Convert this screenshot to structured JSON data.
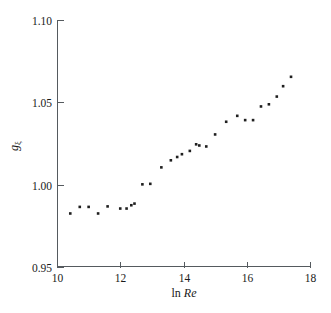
{
  "chart_data": {
    "type": "scatter",
    "title": "",
    "xlabel": "ln Re",
    "xlabel_parts": {
      "prefix": "ln ",
      "italic": "Re"
    },
    "ylabel": "gξ",
    "ylabel_parts": {
      "base": "g",
      "subscript": "ξ"
    },
    "xlim": [
      10,
      18
    ],
    "ylim": [
      0.95,
      1.1
    ],
    "xticks": [
      10,
      12,
      14,
      16,
      18
    ],
    "xtick_labels": [
      "10",
      "12",
      "14",
      "16",
      "18"
    ],
    "yticks": [
      0.95,
      1.0,
      1.05,
      1.1
    ],
    "ytick_labels": [
      "0.95",
      "1.00",
      "1.05",
      "1.10"
    ],
    "grid": false,
    "legend": null,
    "marker": "small-filled-square",
    "marker_color": "#1f1f1f",
    "axis_color": "#555a5e",
    "x": [
      10.42,
      10.72,
      11.0,
      11.3,
      11.6,
      12.0,
      12.2,
      12.35,
      12.45,
      12.7,
      12.95,
      13.3,
      13.6,
      13.8,
      13.95,
      14.2,
      14.4,
      14.5,
      14.72,
      15.0,
      15.35,
      15.7,
      15.95,
      16.2,
      16.45,
      16.7,
      16.95,
      17.15,
      17.4
    ],
    "y": [
      0.9825,
      0.9865,
      0.9865,
      0.9825,
      0.9868,
      0.9855,
      0.9855,
      0.9875,
      0.9885,
      1.0002,
      1.0005,
      1.0105,
      1.0148,
      1.0168,
      1.0185,
      1.0205,
      1.0245,
      1.0238,
      1.0232,
      1.0305,
      1.0382,
      1.0418,
      1.0392,
      1.0392,
      1.0475,
      1.0488,
      1.0535,
      1.0598,
      1.0655
    ],
    "n_points": 29
  },
  "geometry": {
    "plot_left": 57,
    "plot_right": 310,
    "plot_top": 20,
    "plot_bottom": 267
  }
}
